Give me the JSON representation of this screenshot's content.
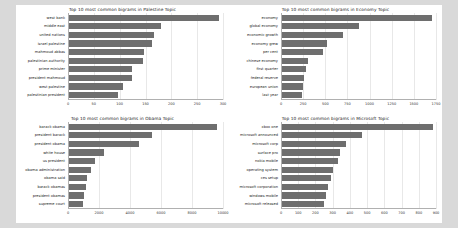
{
  "figure": {
    "background": "#ffffff",
    "page_background": "#d9d9d9",
    "bar_color": "#6e6e6e",
    "grid_color": "#e8e8e8"
  },
  "chart_data": [
    {
      "type": "bar",
      "orientation": "horizontal",
      "title": "Top 10 most common bigrams in Palestine Topic",
      "xlabel": "",
      "ylabel": "",
      "grid": true,
      "legend": "none",
      "xlim": [
        0,
        300
      ],
      "xticks": [
        0,
        50,
        100,
        150,
        200,
        250,
        300
      ],
      "categories": [
        "west bank",
        "middle east",
        "united nations",
        "israel palestine",
        "mahmoud abbas",
        "palestinian authority",
        "prime minister",
        "president mahmoud",
        "west palestine",
        "palestinian president"
      ],
      "values": [
        293,
        180,
        167,
        163,
        147,
        145,
        124,
        124,
        107,
        97
      ]
    },
    {
      "type": "bar",
      "orientation": "horizontal",
      "title": "Top 10 most common bigrams in Economy Topic",
      "xlabel": "",
      "ylabel": "",
      "grid": true,
      "legend": "none",
      "xlim": [
        0,
        1750
      ],
      "xticks": [
        0,
        250,
        500,
        750,
        1000,
        1250,
        1500,
        1750
      ],
      "categories": [
        "economy",
        "global economy",
        "economic growth",
        "economy grew",
        "per cent",
        "chinese economy",
        "first quarter",
        "federal reserve",
        "european union",
        "last year"
      ],
      "values": [
        1700,
        880,
        700,
        520,
        470,
        300,
        285,
        265,
        250,
        235
      ]
    },
    {
      "type": "bar",
      "orientation": "horizontal",
      "title": "Top 10 most common bigrams in Obama Topic",
      "xlabel": "",
      "ylabel": "",
      "grid": true,
      "legend": "none",
      "xlim": [
        0,
        10000
      ],
      "xticks": [
        0,
        2000,
        4000,
        6000,
        8000,
        10000
      ],
      "categories": [
        "barack obama",
        "president barack",
        "president obama",
        "white house",
        "us president",
        "obama administration",
        "obama said",
        "barack obamas",
        "president obamas",
        "supreme court"
      ],
      "values": [
        9600,
        5400,
        4600,
        2300,
        1750,
        1500,
        1250,
        1150,
        1050,
        980
      ]
    },
    {
      "type": "bar",
      "orientation": "horizontal",
      "title": "Top 10 most common bigrams in Microsoft Topic",
      "xlabel": "",
      "ylabel": "",
      "grid": true,
      "legend": "none",
      "xlim": [
        0,
        900
      ],
      "xticks": [
        0,
        100,
        200,
        300,
        400,
        500,
        600,
        700,
        800,
        900
      ],
      "categories": [
        "xbox one",
        "microsoft announced",
        "microsoft corp",
        "surface pro",
        "nokia mobile",
        "operating system",
        "ces setup",
        "microsoft corporation",
        "windows mobile",
        "microsoft released"
      ],
      "values": [
        880,
        470,
        380,
        340,
        330,
        300,
        290,
        270,
        260,
        250
      ]
    }
  ]
}
